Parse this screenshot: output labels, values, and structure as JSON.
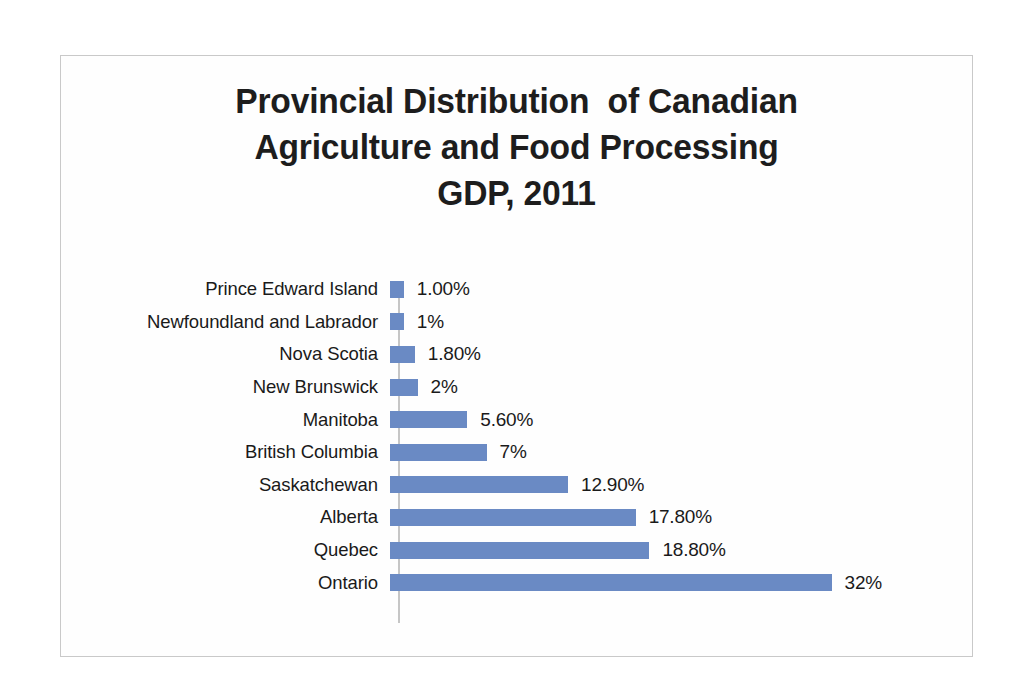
{
  "chart_data": {
    "type": "bar",
    "orientation": "horizontal",
    "title": "Provincial Distribution  of Canadian Agriculture and Food Processing GDP, 2011",
    "title_lines": [
      "Provincial Distribution  of Canadian",
      "Agriculture and Food Processing",
      "GDP, 2011"
    ],
    "xlabel": "",
    "ylabel": "",
    "categories": [
      "Prince Edward Island",
      "Newfoundland and Labrador",
      "Nova Scotia",
      "New Brunswick",
      "Manitoba",
      "British Columbia",
      "Saskatchewan",
      "Alberta",
      "Quebec",
      "Ontario"
    ],
    "values": [
      1.0,
      1.0,
      1.8,
      2.0,
      5.6,
      7.0,
      12.9,
      17.8,
      18.8,
      32.0
    ],
    "data_labels": [
      "1.00%",
      "1%",
      "1.80%",
      "2%",
      "5.60%",
      "7%",
      "12.90%",
      "17.80%",
      "18.80%",
      "32%"
    ],
    "xlim": [
      0,
      32
    ],
    "grid": false,
    "legend": false,
    "axis_tick_labels": [],
    "series": [
      {
        "name": "Share of GDP",
        "color": "#6a8ac4",
        "values": [
          1.0,
          1.0,
          1.8,
          2.0,
          5.6,
          7.0,
          12.9,
          17.8,
          18.8,
          32.0
        ]
      }
    ],
    "colors": {
      "bar": "#6a8ac4",
      "axis_line": "#c6c6c6",
      "frame_border": "#c9c9c9",
      "text": "#1a1a1a",
      "background": "#fefefe"
    },
    "px_per_percent": 13.8
  }
}
